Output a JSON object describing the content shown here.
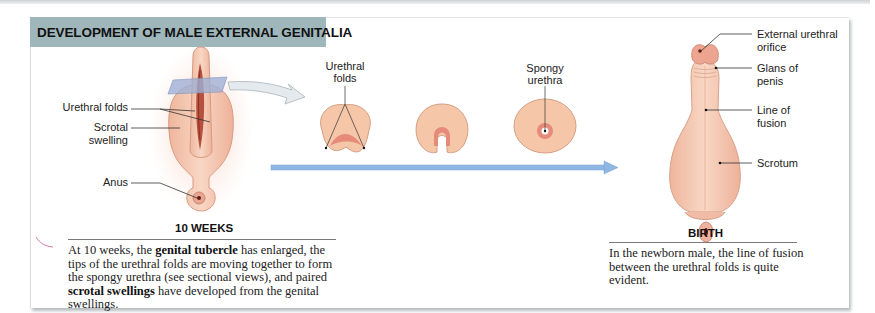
{
  "figure": {
    "title": "DEVELOPMENT OF MALE EXTERNAL GENITALIA",
    "colors": {
      "header_bg": "#9fb7bb",
      "tissue": "#f3c9ad",
      "tissue_dark": "#e38b78",
      "timeline_arrow": "#8fb7e3",
      "section_plane": "#9fb0d6"
    }
  },
  "stage_10_weeks": {
    "label": "10 WEEKS",
    "annotations": {
      "urethral_folds": "Urethral folds",
      "scrotal_swelling_1": "Scrotal",
      "scrotal_swelling_2": "swelling",
      "anus": "Anus"
    },
    "caption": {
      "p1": "At 10 weeks, the ",
      "b1": "genital tubercle",
      "p2": " has enlarged, the tips of the urethral folds are moving together to form the spongy urethra (see sectional views), and paired ",
      "b2": "scrotal swellings",
      "p3": " have developed from the genital swellings."
    }
  },
  "sectional_views": {
    "label_urethral_folds_1": "Urethral",
    "label_urethral_folds_2": "folds",
    "label_spongy_urethra_1": "Spongy",
    "label_spongy_urethra_2": "urethra"
  },
  "stage_birth": {
    "label": "BIRTH",
    "annotations": {
      "external_urethral_orifice_1": "External urethral",
      "external_urethral_orifice_2": "orifice",
      "glans_1": "Glans of",
      "glans_2": "penis",
      "line_of_fusion_1": "Line of",
      "line_of_fusion_2": "fusion",
      "scrotum": "Scrotum"
    },
    "caption": "In the newborn male, the line of fusion between the urethral folds is quite evident."
  }
}
